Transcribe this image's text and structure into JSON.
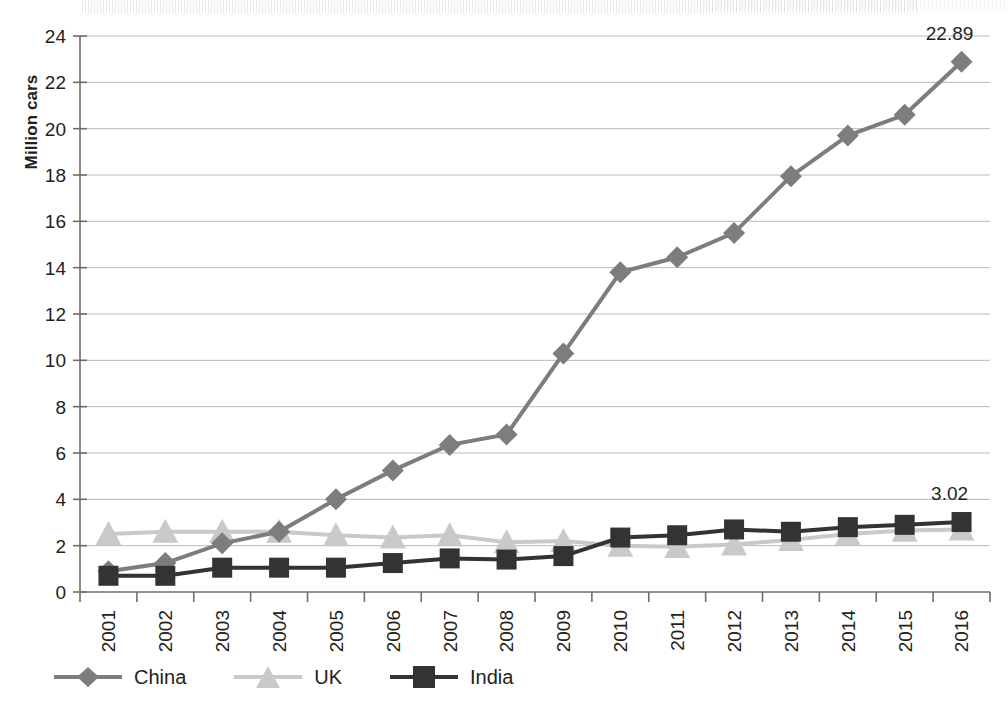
{
  "chart_data": {
    "type": "line",
    "title": "",
    "xlabel": "",
    "ylabel": "Million cars",
    "ylim": [
      0,
      24
    ],
    "ytick_step": 2,
    "yticks": [
      "0",
      "2",
      "4",
      "6",
      "8",
      "10",
      "12",
      "14",
      "16",
      "18",
      "20",
      "22",
      "24"
    ],
    "grid": true,
    "legend_position": "bottom-left",
    "categories": [
      "2001",
      "2002",
      "2003",
      "2004",
      "2005",
      "2006",
      "2007",
      "2008",
      "2009",
      "2010",
      "2011",
      "2012",
      "2013",
      "2014",
      "2015",
      "2016"
    ],
    "series": [
      {
        "name": "China",
        "marker": "diamond",
        "color": "#7d7d7d",
        "values": [
          0.9,
          1.25,
          2.1,
          2.6,
          4.0,
          5.25,
          6.35,
          6.8,
          10.3,
          13.8,
          14.45,
          15.5,
          17.95,
          19.7,
          20.6,
          22.89
        ]
      },
      {
        "name": "UK",
        "marker": "triangle",
        "color": "#c9c9c9",
        "values": [
          2.5,
          2.6,
          2.6,
          2.6,
          2.45,
          2.35,
          2.45,
          2.15,
          2.2,
          2.0,
          1.95,
          2.05,
          2.25,
          2.5,
          2.65,
          2.7
        ]
      },
      {
        "name": "India",
        "marker": "square",
        "color": "#333333",
        "values": [
          0.7,
          0.7,
          1.05,
          1.05,
          1.05,
          1.25,
          1.45,
          1.4,
          1.55,
          2.35,
          2.45,
          2.7,
          2.6,
          2.8,
          2.9,
          3.02
        ]
      }
    ],
    "data_labels": [
      {
        "series": "China",
        "category": "2016",
        "text": "22.89"
      },
      {
        "series": "India",
        "category": "2016",
        "text": "3.02"
      }
    ]
  },
  "legend": {
    "items": [
      {
        "label": "China",
        "marker": "diamond-icon",
        "color": "#7d7d7d"
      },
      {
        "label": "UK",
        "marker": "triangle-icon",
        "color": "#c9c9c9"
      },
      {
        "label": "India",
        "marker": "square-icon",
        "color": "#333333"
      }
    ]
  }
}
